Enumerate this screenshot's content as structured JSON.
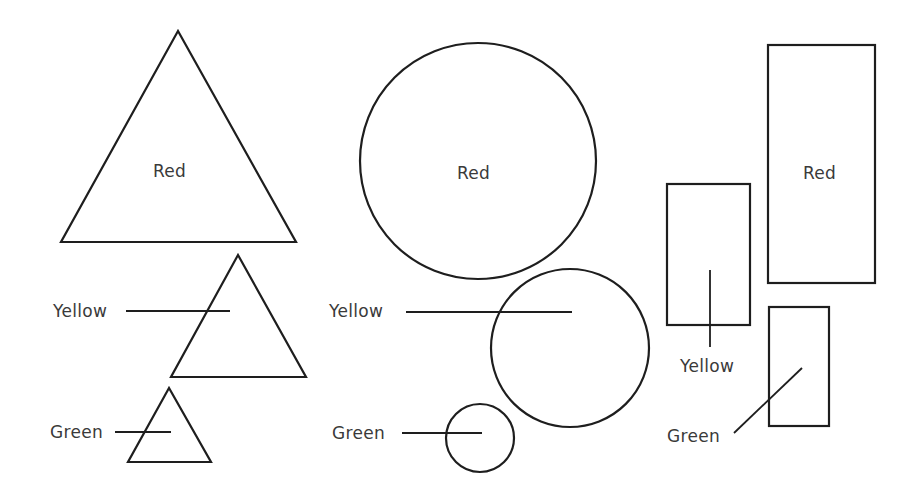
{
  "diagram": {
    "stroke_color": "#1e1e1e",
    "label_color": "#3a3a3a",
    "groups": [
      {
        "shape": "triangle",
        "items": [
          {
            "label": "Red",
            "size": "large",
            "label_position": "inside"
          },
          {
            "label": "Yellow",
            "size": "medium",
            "label_position": "leader-left"
          },
          {
            "label": "Green",
            "size": "small",
            "label_position": "leader-left"
          }
        ]
      },
      {
        "shape": "circle",
        "items": [
          {
            "label": "Red",
            "size": "large",
            "label_position": "inside"
          },
          {
            "label": "Yellow",
            "size": "medium",
            "label_position": "leader-left"
          },
          {
            "label": "Green",
            "size": "small",
            "label_position": "leader-left"
          }
        ]
      },
      {
        "shape": "rectangle",
        "items": [
          {
            "label": "Red",
            "size": "large",
            "label_position": "inside"
          },
          {
            "label": "Yellow",
            "size": "medium",
            "label_position": "leader-below"
          },
          {
            "label": "Green",
            "size": "small",
            "label_position": "leader-diagonal"
          }
        ]
      }
    ]
  }
}
